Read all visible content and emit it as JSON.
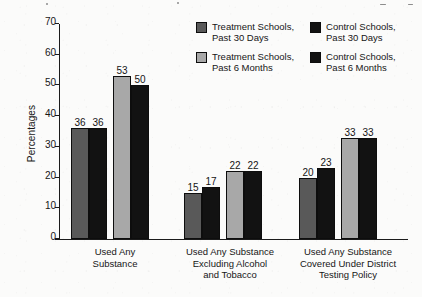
{
  "chart_data": {
    "type": "bar",
    "title": "",
    "xlabel": "",
    "ylabel": "Percentages",
    "ylim": [
      0,
      70
    ],
    "yticks": [
      0,
      10,
      20,
      30,
      40,
      50,
      60,
      70
    ],
    "grid": false,
    "legend_position": "top-right",
    "categories": [
      "Used Any\nSubstance",
      "Used Any Substance\nExcluding Alcohol\nand Tobacco",
      "Used Any Substance\nCovered Under District\nTesting Policy"
    ],
    "series": [
      {
        "name": "Treatment Schools,\nPast 30 Days",
        "color": "#595959",
        "values": [
          36,
          15,
          20
        ]
      },
      {
        "name": "Control Schools,\nPast 30 Days",
        "color": "#121212",
        "values": [
          36,
          17,
          23
        ]
      },
      {
        "name": "Treatment Schools,\nPast 6 Months",
        "color": "#a8a8a8",
        "values": [
          53,
          22,
          33
        ]
      },
      {
        "name": "Control Schools,\nPast 6 Months",
        "color": "#121212",
        "values": [
          50,
          22,
          33
        ]
      }
    ]
  },
  "legend": {
    "items": [
      {
        "label": "Treatment Schools,\nPast 30 Days",
        "color": "#595959"
      },
      {
        "label": "Control Schools,\nPast 30 Days",
        "color": "#121212"
      },
      {
        "label": "Treatment Schools,\nPast 6 Months",
        "color": "#a8a8a8"
      },
      {
        "label": "Control Schools,\nPast 6 Months",
        "color": "#121212"
      }
    ]
  }
}
